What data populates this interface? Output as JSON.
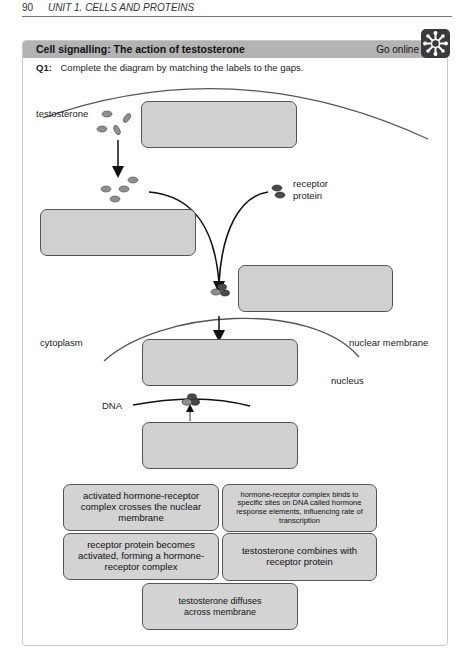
{
  "page_header": {
    "page_number": "90",
    "unit_title": "UNIT 1. CELLS AND PROTEINS"
  },
  "activity": {
    "title": "Cell signalling: The action of testosterone",
    "go_online_label": "Go online",
    "go_online_icon": "snowflake-network-icon"
  },
  "question": {
    "number": "Q1:",
    "text": "Complete the diagram by matching the labels to the gaps."
  },
  "diagram_labels": {
    "testosterone": "testosterone",
    "receptor_protein_line1": "receptor",
    "receptor_protein_line2": "protein",
    "cytoplasm": "cytoplasm",
    "nuclear_membrane": "nuclear membrane",
    "nucleus": "nucleus",
    "dna": "DNA"
  },
  "gaps": [
    {
      "id": "gap-1",
      "value": ""
    },
    {
      "id": "gap-2",
      "value": ""
    },
    {
      "id": "gap-3",
      "value": ""
    },
    {
      "id": "gap-4",
      "value": ""
    },
    {
      "id": "gap-5",
      "value": ""
    }
  ],
  "answer_tiles": [
    {
      "text": "activated hormone-receptor complex crosses the nuclear membrane"
    },
    {
      "text": "hormone-receptor complex binds to specific sites on DNA called hormone response elements, influencing rate of transcription"
    },
    {
      "text": "receptor protein becomes activated, forming a hormone-receptor complex"
    },
    {
      "text": "testosterone combines with receptor protein"
    },
    {
      "text": "testosterone diffuses across membrane"
    }
  ],
  "colors": {
    "header_bar": "#b3b3b3",
    "gap_fill": "#d0d0d0",
    "molecule_light": "#8f8f8f",
    "molecule_dark": "#4a4a4a"
  }
}
